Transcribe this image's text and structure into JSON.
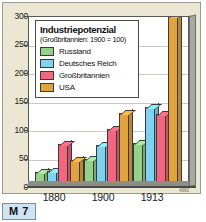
{
  "figure": {
    "badge": "M 7",
    "source_code": "4960"
  },
  "legend": {
    "title": "Industriepotenzial",
    "subtitle": "(Großbritannien: 1900 = 100)",
    "items": [
      {
        "label": "Russland",
        "color": "#95d18a"
      },
      {
        "label": "Deutsches Reich",
        "color": "#7fd2f2"
      },
      {
        "label": "Großbritannien",
        "color": "#f4657f"
      },
      {
        "label": "USA",
        "color": "#e0a33f"
      }
    ]
  },
  "chart_data": {
    "type": "bar",
    "title": "Industriepotenzial",
    "subtitle": "(Großbritannien: 1900 = 100)",
    "xlabel": "",
    "ylabel": "",
    "ylim": [
      0,
      300
    ],
    "yticks": [
      0,
      50,
      100,
      150,
      200,
      250,
      300
    ],
    "grid": true,
    "legend_position": "top-left",
    "categories": [
      "1880",
      "1900",
      "1913"
    ],
    "series": [
      {
        "name": "Russland",
        "color": "#95d18a",
        "values": [
          25,
          48,
          76
        ]
      },
      {
        "name": "Deutsches Reich",
        "color": "#7fd2f2",
        "values": [
          27,
          72,
          138
        ]
      },
      {
        "name": "Großbritannien",
        "color": "#f4657f",
        "values": [
          73,
          100,
          127
        ]
      },
      {
        "name": "USA",
        "color": "#e0a33f",
        "values": [
          46,
          128,
          298
        ]
      }
    ]
  }
}
